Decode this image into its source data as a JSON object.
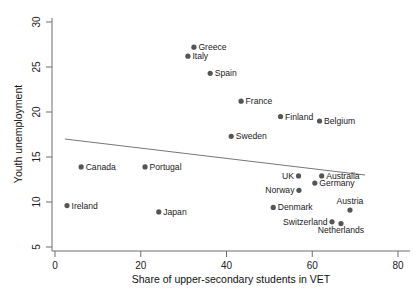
{
  "chart_data": {
    "type": "scatter",
    "title": "",
    "xlabel": "Share of upper-secondary students in VET",
    "ylabel": "Youth unemployment",
    "xlim": [
      0,
      80
    ],
    "ylim": [
      5,
      30
    ],
    "xticks": [
      0,
      20,
      40,
      60,
      80
    ],
    "yticks": [
      5,
      10,
      15,
      20,
      25,
      30
    ],
    "grid": false,
    "legend": "none",
    "marker_color": "#555555",
    "fitline": {
      "label": "linear fit",
      "color": "#777777",
      "x": [
        2.3,
        72.3
      ],
      "y": [
        17.0,
        13.0
      ]
    },
    "points": [
      {
        "label": "Greece",
        "x": 32.4,
        "y": 27.2,
        "label_pos": "right"
      },
      {
        "label": "Italy",
        "x": 31.0,
        "y": 26.2,
        "label_pos": "right"
      },
      {
        "label": "Spain",
        "x": 36.2,
        "y": 24.3,
        "label_pos": "right"
      },
      {
        "label": "France",
        "x": 43.4,
        "y": 21.2,
        "label_pos": "right"
      },
      {
        "label": "Finland",
        "x": 52.6,
        "y": 19.5,
        "label_pos": "right"
      },
      {
        "label": "Belgium",
        "x": 61.7,
        "y": 19.0,
        "label_pos": "right"
      },
      {
        "label": "Sweden",
        "x": 41.1,
        "y": 17.3,
        "label_pos": "right"
      },
      {
        "label": "Canada",
        "x": 6.1,
        "y": 13.9,
        "label_pos": "right"
      },
      {
        "label": "Portugal",
        "x": 21.0,
        "y": 13.9,
        "label_pos": "right"
      },
      {
        "label": "UK",
        "x": 56.8,
        "y": 12.9,
        "label_pos": "left"
      },
      {
        "label": "Australia",
        "x": 62.2,
        "y": 12.9,
        "label_pos": "right"
      },
      {
        "label": "Germany",
        "x": 60.6,
        "y": 12.1,
        "label_pos": "right"
      },
      {
        "label": "Norway",
        "x": 56.9,
        "y": 11.3,
        "label_pos": "left"
      },
      {
        "label": "Ireland",
        "x": 2.8,
        "y": 9.6,
        "label_pos": "right"
      },
      {
        "label": "Japan",
        "x": 24.2,
        "y": 8.9,
        "label_pos": "right"
      },
      {
        "label": "Denmark",
        "x": 50.9,
        "y": 9.4,
        "label_pos": "right"
      },
      {
        "label": "Austria",
        "x": 68.8,
        "y": 9.1,
        "label_pos": "above"
      },
      {
        "label": "Switzerland",
        "x": 64.6,
        "y": 7.8,
        "label_pos": "left"
      },
      {
        "label": "Netherlands",
        "x": 66.7,
        "y": 7.6,
        "label_pos": "below"
      }
    ]
  }
}
